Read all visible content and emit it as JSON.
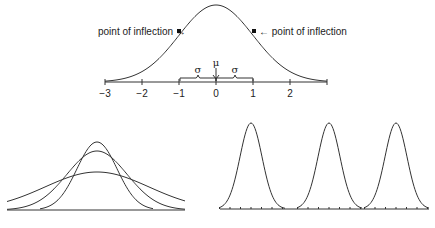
{
  "top_figure": {
    "title": "Normal distribution curve",
    "inflection_left_label": "point of inflection →",
    "inflection_right_label": "← point of inflection",
    "mu_label": "μ",
    "sigma_left_label": "σ",
    "sigma_right_label": "σ",
    "axis_ticks": [
      "−3",
      "−2",
      "−1",
      "0",
      "1",
      "2"
    ],
    "axis_range": [
      -3,
      3
    ]
  },
  "bottom_left_figure": {
    "description": "Three normal curves with same mean, different standard deviations",
    "curves": [
      {
        "name": "small-sigma",
        "relative_height": 1.0
      },
      {
        "name": "medium-sigma",
        "relative_height": 0.87
      },
      {
        "name": "large-sigma",
        "relative_height": 0.56
      }
    ]
  },
  "bottom_right_figure": {
    "description": "Three normal curves with same standard deviation, different means",
    "curves": [
      {
        "name": "mean-1"
      },
      {
        "name": "mean-2"
      },
      {
        "name": "mean-3"
      }
    ]
  },
  "colors": {
    "line": "#333333",
    "text": "#222222",
    "background": "#ffffff"
  }
}
